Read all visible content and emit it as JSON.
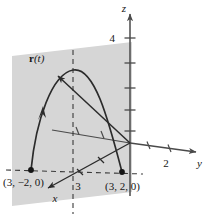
{
  "figure": {
    "kind": "3d-vector-valued-function-plot",
    "background_color": "#ffffff",
    "plane": {
      "fill_color": "#d6d6d6",
      "name": "vertical-plane-x-equals-3"
    },
    "axes": {
      "z": {
        "label": "z",
        "ticks": [
          "4"
        ],
        "stroke_color": "#4a4a4a"
      },
      "y": {
        "label": "y",
        "ticks": [
          "2"
        ],
        "stroke_color": "#4a4a4a"
      },
      "x": {
        "label": "x",
        "ticks": [
          "3"
        ],
        "stroke_color": "#2b2b2b"
      }
    },
    "curve": {
      "label_bold": "r",
      "label_paren_open": "(",
      "label_italic": "t",
      "label_paren_close": ")",
      "stroke_color": "#2b2b2b"
    },
    "points": [
      {
        "name": "left-endpoint",
        "label": "(3, −2, 0)"
      },
      {
        "name": "right-endpoint",
        "label": "(3, 2, 0)"
      }
    ],
    "guides": {
      "dash_color": "#3a3a3a"
    }
  }
}
